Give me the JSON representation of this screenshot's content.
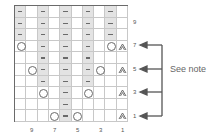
{
  "chart": {
    "columns": 10,
    "rows": 10,
    "column_order": "right-to-left",
    "row_order": "bottom-to-top",
    "cells": {
      "10": [
        "dash",
        "empty",
        "dash",
        "empty",
        "dash",
        "empty",
        "dash",
        "empty",
        "dash",
        "empty"
      ],
      "9": [
        "dash",
        "empty",
        "dash",
        "empty",
        "dash",
        "empty",
        "dash",
        "empty",
        "dash",
        "empty"
      ],
      "8": [
        "dash",
        "empty",
        "dash",
        "empty",
        "dash",
        "empty",
        "dash",
        "empty",
        "dash",
        "empty"
      ],
      "7": [
        "yo",
        "empty",
        "dash",
        "empty",
        "dash",
        "empty",
        "dash",
        "empty",
        "yo",
        "dec"
      ],
      "6": [
        "empty",
        "empty",
        "dash",
        "empty",
        "dash",
        "empty",
        "dash",
        "empty",
        "empty",
        "empty"
      ],
      "5": [
        "empty",
        "yo",
        "dash",
        "empty",
        "dash",
        "empty",
        "dash",
        "yo",
        "empty",
        "dec"
      ],
      "4": [
        "empty",
        "empty",
        "dash",
        "empty",
        "dash",
        "empty",
        "dash",
        "empty",
        "empty",
        "empty"
      ],
      "3": [
        "empty",
        "empty",
        "yo",
        "empty",
        "dash",
        "empty",
        "yo",
        "empty",
        "empty",
        "dec"
      ],
      "2": [
        "empty",
        "empty",
        "empty",
        "empty",
        "dash",
        "empty",
        "empty",
        "empty",
        "empty",
        "empty"
      ],
      "1": [
        "empty",
        "empty",
        "empty",
        "yo",
        "dash",
        "yo",
        "empty",
        "empty",
        "empty",
        "dec"
      ]
    },
    "row_labels": [
      "9",
      "7",
      "5",
      "3",
      "1"
    ],
    "col_labels": [
      "9",
      "7",
      "5",
      "3",
      "1"
    ],
    "note_text": "See note",
    "arrow_rows": [
      "7",
      "5",
      "3",
      "1"
    ],
    "colors": {
      "shade": "#e3e3e3",
      "line": "#6a6a6a",
      "grid": "#c8c8c8"
    }
  }
}
